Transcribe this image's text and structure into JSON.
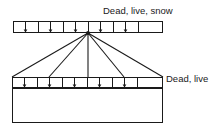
{
  "figure": {
    "type": "structural-engineering-diagram",
    "background_color": "#ffffff",
    "line_color": "#1a1a1a"
  },
  "labels": {
    "top_load": "Dead, live, snow",
    "lower_load": "Dead, live"
  },
  "top_member": {
    "name": "upper-chord-bar",
    "x": 13,
    "y": 21,
    "width": 150,
    "height": 12,
    "divider_positions": [
      38,
      63,
      88,
      113,
      138
    ],
    "arrow_positions": [
      25,
      50,
      75,
      100,
      125
    ],
    "arrow_direction": "down"
  },
  "apex": {
    "name": "truss-apex-node",
    "x": 88,
    "y": 33
  },
  "lower_member": {
    "name": "lower-chord-bar",
    "x": 12,
    "y": 77,
    "width": 151,
    "height": 11,
    "divider_positions": [
      37,
      62,
      87,
      112,
      137
    ],
    "arrow_positions": [
      24,
      49,
      74,
      99,
      124
    ],
    "arrow_direction": "down"
  },
  "web_members": {
    "name": "truss-web-members",
    "count": 5,
    "bottom_node_x": [
      12,
      49,
      88,
      124,
      163
    ],
    "bottom_node_y": 77
  },
  "base_box": {
    "name": "supporting-wall-box",
    "x": 12,
    "y": 88,
    "width": 151,
    "height": 35
  },
  "label_positions": {
    "top_load": {
      "x": 103,
      "y": 14
    },
    "lower_load": {
      "x": 166,
      "y": 82
    }
  }
}
